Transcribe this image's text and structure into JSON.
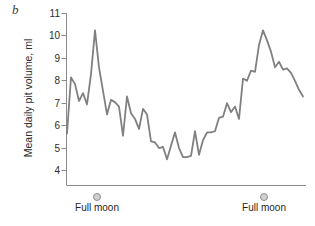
{
  "panel": {
    "letter": "b"
  },
  "axes": {
    "y_title": "Mean daily pit volume, ml",
    "y_ticks": [
      "11",
      "10",
      "9",
      "8",
      "7",
      "6",
      "5",
      "4"
    ]
  },
  "annotations": {
    "full_moon_left": "Full moon",
    "full_moon_right": "Full moon",
    "marker_icon": "full-moon-circle-icon"
  },
  "colors": {
    "line": "#808080",
    "axis": "#8a8a8a",
    "text": "#2b2b2b",
    "moon_fill": "#cfcfcf",
    "moon_stroke": "#8d8d8d"
  },
  "chart_data": {
    "type": "line",
    "title": "",
    "subtitle": "",
    "xlabel": "",
    "ylabel": "Mean daily pit volume, ml",
    "ylim": [
      3.4,
      11
    ],
    "xlim": [
      0,
      59
    ],
    "grid": false,
    "legend": null,
    "y_ticks": [
      4,
      5,
      6,
      7,
      8,
      9,
      10,
      11
    ],
    "x_ticks": [],
    "annotations": [
      {
        "label": "Full moon",
        "x": 8,
        "marker": "circle"
      },
      {
        "label": "Full moon",
        "x": 44,
        "marker": "circle"
      }
    ],
    "x": [
      0,
      1,
      2,
      3,
      4,
      5,
      6,
      7,
      8,
      9,
      10,
      11,
      12,
      13,
      14,
      15,
      16,
      17,
      18,
      19,
      20,
      21,
      22,
      23,
      24,
      25,
      26,
      27,
      28,
      29,
      30,
      31,
      32,
      33,
      34,
      35,
      36,
      37,
      38,
      39,
      40,
      41,
      42,
      43,
      44,
      45,
      46,
      47,
      48,
      49,
      50,
      51,
      52,
      53,
      54,
      55,
      56,
      57,
      58,
      59
    ],
    "values": [
      5.65,
      8.15,
      7.85,
      7.1,
      7.45,
      6.95,
      8.3,
      10.25,
      8.6,
      7.55,
      6.5,
      7.15,
      7.05,
      6.85,
      5.55,
      7.3,
      6.55,
      6.3,
      5.85,
      6.75,
      6.5,
      5.3,
      5.25,
      5.0,
      5.05,
      4.5,
      5.1,
      5.7,
      5.0,
      4.6,
      4.6,
      4.65,
      5.75,
      4.7,
      5.35,
      5.7,
      5.7,
      5.75,
      6.35,
      6.4,
      7.0,
      6.6,
      6.85,
      6.3,
      8.1,
      8.0,
      8.45,
      8.4,
      9.6,
      10.25,
      9.8,
      9.3,
      8.6,
      8.85,
      8.5,
      8.55,
      8.35,
      8.0,
      7.6,
      7.3
    ],
    "series": [
      {
        "name": "Mean daily pit volume",
        "values": [
          5.65,
          8.15,
          7.85,
          7.1,
          7.45,
          6.95,
          8.3,
          10.25,
          8.6,
          7.55,
          6.5,
          7.15,
          7.05,
          6.85,
          5.55,
          7.3,
          6.55,
          6.3,
          5.85,
          6.75,
          6.5,
          5.3,
          5.25,
          5.0,
          5.05,
          4.5,
          5.1,
          5.7,
          5.0,
          4.6,
          4.6,
          4.65,
          5.75,
          4.7,
          5.35,
          5.7,
          5.7,
          5.75,
          6.35,
          6.4,
          7.0,
          6.6,
          6.85,
          6.3,
          8.1,
          8.0,
          8.45,
          8.4,
          9.6,
          10.25,
          9.8,
          9.3,
          8.6,
          8.85,
          8.5,
          8.55,
          8.35,
          8.0,
          7.6,
          7.3
        ]
      }
    ]
  }
}
